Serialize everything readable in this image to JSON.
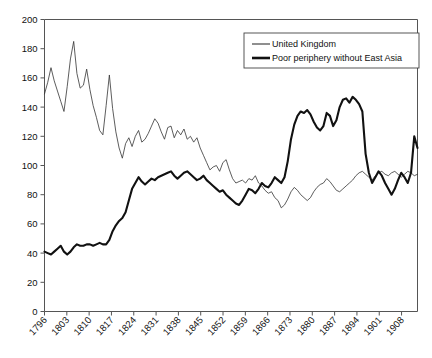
{
  "chart_data": {
    "type": "line",
    "title": "",
    "subtitle": "",
    "xlabel": "",
    "ylabel": "",
    "xlim": [
      1796,
      1913
    ],
    "ylim": [
      0,
      200
    ],
    "grid": false,
    "legend_position": "top-right",
    "x_tick_labels": [
      "1796",
      "1803",
      "1810",
      "1817",
      "1824",
      "1831",
      "1838",
      "1845",
      "1852",
      "1859",
      "1866",
      "1873",
      "1880",
      "1887",
      "1894",
      "1901",
      "1908"
    ],
    "y_tick_labels": [
      "0",
      "20",
      "40",
      "60",
      "80",
      "100",
      "120",
      "140",
      "160",
      "180",
      "200"
    ],
    "x_ticks": [
      1796,
      1803,
      1810,
      1817,
      1824,
      1831,
      1838,
      1845,
      1852,
      1859,
      1866,
      1873,
      1880,
      1887,
      1894,
      1901,
      1908
    ],
    "y_ticks": [
      0,
      20,
      40,
      60,
      80,
      100,
      120,
      140,
      160,
      180,
      200
    ],
    "x_start": 1796,
    "x_step": 1,
    "series": [
      {
        "name": "United Kingdom",
        "style": "thin",
        "color": "#333333",
        "values": [
          149,
          157,
          167,
          158,
          151,
          144,
          137,
          154,
          173,
          185,
          163,
          153,
          155,
          166,
          152,
          141,
          133,
          124,
          121,
          141,
          162,
          139,
          123,
          112,
          105,
          115,
          119,
          113,
          120,
          124,
          116,
          118,
          122,
          127,
          132,
          129,
          123,
          118,
          126,
          127,
          119,
          124,
          121,
          125,
          118,
          120,
          116,
          119,
          112,
          107,
          102,
          97,
          99,
          100,
          96,
          102,
          104,
          97,
          91,
          88,
          89,
          90,
          88,
          91,
          90,
          93,
          88,
          86,
          83,
          81,
          82,
          78,
          76,
          71,
          73,
          77,
          82,
          85,
          83,
          80,
          78,
          76,
          78,
          82,
          85,
          87,
          88,
          91,
          89,
          86,
          83,
          82,
          84,
          86,
          88,
          90,
          93,
          95,
          96,
          94,
          92,
          90,
          93,
          95,
          96,
          94,
          93,
          95,
          96,
          94,
          92,
          94,
          96,
          95,
          93,
          94
        ]
      },
      {
        "name": "Poor periphery without East Asia",
        "style": "thick",
        "color": "#111111",
        "values": [
          41,
          40,
          39,
          41,
          43,
          45,
          41,
          39,
          41,
          44,
          46,
          45,
          45,
          46,
          46,
          45,
          46,
          47,
          46,
          46,
          49,
          55,
          59,
          62,
          64,
          68,
          76,
          84,
          88,
          92,
          89,
          87,
          89,
          91,
          90,
          92,
          93,
          94,
          95,
          96,
          93,
          91,
          93,
          95,
          96,
          94,
          92,
          90,
          91,
          93,
          90,
          88,
          86,
          84,
          82,
          83,
          80,
          78,
          76,
          74,
          73,
          76,
          80,
          84,
          83,
          81,
          84,
          88,
          86,
          85,
          88,
          92,
          90,
          88,
          92,
          103,
          118,
          128,
          134,
          137,
          136,
          138,
          135,
          130,
          126,
          124,
          127,
          136,
          134,
          127,
          131,
          140,
          145,
          146,
          143,
          147,
          145,
          142,
          137,
          108,
          95,
          88,
          92,
          96,
          93,
          88,
          84,
          80,
          84,
          90,
          95,
          92,
          88,
          95,
          120,
          112
        ]
      }
    ]
  },
  "legend": {
    "entries": [
      {
        "label": "United Kingdom"
      },
      {
        "label": "Poor periphery without East Asia"
      }
    ]
  },
  "axes": {
    "y_max_label": "200",
    "x_first_label": "1796",
    "x_last_label": "1908"
  }
}
